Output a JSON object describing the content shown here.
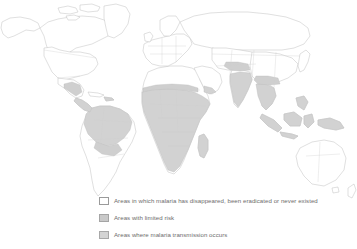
{
  "map": {
    "title": "World map of malaria distribution",
    "projection": "equirectangular",
    "background_color": "#ffffff",
    "coastline_color": "#b9b9b9",
    "border_color": "#cfcfcf",
    "fill_none_color": "#ffffff",
    "fill_limited_color": "#cfcfcf",
    "fill_transmission_color": "#d2d2d2"
  },
  "legend": {
    "items": [
      {
        "swatch": "white",
        "label": "Areas in which malaria has disappeared, been eradicated or never existed"
      },
      {
        "swatch": "limited",
        "label": "Areas with limited risk"
      },
      {
        "swatch": "transmission",
        "label": "Areas where malaria transmission occurs"
      }
    ]
  }
}
